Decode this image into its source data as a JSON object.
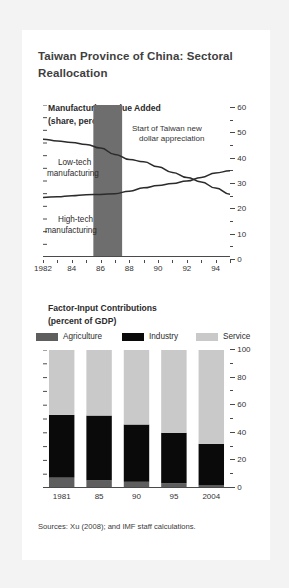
{
  "figure": {
    "title": "Taiwan Province of China: Sectoral Reallocation",
    "sources": "Sources: Xu (2008); and IMF staff calculations."
  },
  "colors": {
    "agriculture": "#5e5e5e",
    "industry": "#0a0a0a",
    "service": "#c9c9c9",
    "band": "#6e6e6e",
    "line": "#2b2b2b",
    "axis": "#4a4a4a",
    "card": "#ffffff",
    "page": "#f3f3f3"
  },
  "chart_data": [
    {
      "type": "line",
      "title": "Manufacturing Value Added",
      "subtitle": "(share, percent)",
      "xlabel": "",
      "ylabel": "",
      "ylim": [
        0,
        60
      ],
      "yticks": [
        0,
        10,
        20,
        30,
        40,
        50,
        60
      ],
      "ytick_labels": [
        "0",
        "10",
        "20",
        "30",
        "40",
        "50",
        "60"
      ],
      "yminor_step": 5,
      "xlim": [
        1982,
        1995
      ],
      "xticks": [
        1982,
        1984,
        1986,
        1988,
        1990,
        1992,
        1994
      ],
      "xtick_labels": [
        "1982",
        "84",
        "86",
        "88",
        "90",
        "92",
        "94"
      ],
      "grid": false,
      "legend_position": "inline-annotation",
      "annotations": [
        {
          "name": "band-label",
          "line1": "Start of Taiwan new",
          "line2": "dollar appreciation"
        },
        {
          "name": "low-tech-label",
          "line1": "Low-tech",
          "line2": "manufacturing"
        },
        {
          "name": "high-tech-label",
          "line1": "High-tech",
          "line2": "manufacturing"
        }
      ],
      "shaded_band": {
        "label": "Start of Taiwan new dollar appreciation",
        "x_start": 1985.5,
        "x_end": 1987.5
      },
      "x": [
        1982,
        1983,
        1984,
        1985,
        1986,
        1987,
        1988,
        1989,
        1990,
        1991,
        1992,
        1993,
        1994,
        1995
      ],
      "series": [
        {
          "name": "Low-tech manufacturing",
          "values": [
            46.5,
            45.8,
            45.2,
            44.4,
            43.0,
            40.5,
            38.5,
            37.6,
            35.6,
            33.4,
            31.4,
            29.6,
            27.2,
            24.8
          ]
        },
        {
          "name": "High-tech manufacturing",
          "values": [
            23.5,
            23.8,
            24.2,
            24.6,
            24.7,
            25.0,
            26.0,
            27.3,
            28.2,
            29.0,
            30.0,
            31.4,
            33.2,
            34.0
          ]
        }
      ]
    },
    {
      "type": "bar",
      "bar_mode": "stacked",
      "title": "Factor-Input Contributions",
      "subtitle": "(percent of GDP)",
      "xlabel": "",
      "ylabel": "",
      "ylim": [
        0,
        100
      ],
      "yticks": [
        0,
        20,
        40,
        60,
        80,
        100
      ],
      "ytick_labels": [
        "0",
        "20",
        "40",
        "60",
        "80",
        "100"
      ],
      "yminor_step": 10,
      "grid": false,
      "legend_position": "top",
      "categories": [
        "1981",
        "85",
        "90",
        "95",
        "2004"
      ],
      "series": [
        {
          "name": "Agriculture",
          "values": [
            7.5,
            5.5,
            4.5,
            3.5,
            1.8
          ]
        },
        {
          "name": "Industry",
          "values": [
            45.5,
            47.0,
            41.5,
            36.5,
            30.2
          ]
        },
        {
          "name": "Service",
          "values": [
            47.0,
            47.5,
            54.0,
            60.0,
            68.0
          ]
        }
      ]
    }
  ]
}
